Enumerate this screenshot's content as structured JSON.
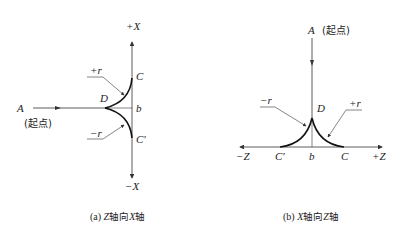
{
  "figure_a": {
    "caption_prefix": "(a) ",
    "caption_axis1": "Z",
    "caption_mid": "轴向",
    "caption_axis2": "X",
    "caption_suffix": "轴",
    "labels": {
      "plus_x": "+X",
      "minus_x": "−X",
      "A": "A",
      "start": "(起点)",
      "D": "D",
      "C": "C",
      "C_prime": "C'",
      "b": "b",
      "plus_r": "+r",
      "minus_r": "−r"
    }
  },
  "figure_b": {
    "caption_prefix": "(b) ",
    "caption_axis1": "X",
    "caption_mid": "轴向",
    "caption_axis2": "Z",
    "caption_suffix": "轴",
    "labels": {
      "A": "A",
      "start": "(起点)",
      "D": "D",
      "C": "C",
      "C_prime": "C'",
      "b": "b",
      "plus_r": "+r",
      "minus_r": "−r",
      "minus_z": "−Z",
      "plus_z": "+Z"
    }
  },
  "colors": {
    "line": "#333333",
    "text": "#222222",
    "background": "#ffffff"
  }
}
